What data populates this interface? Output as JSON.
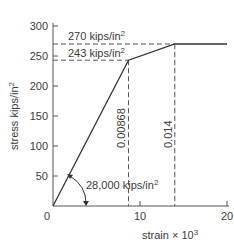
{
  "chart_data": {
    "type": "line",
    "title": "",
    "xlabel": "strain",
    "xlabel_suffix": "× 10",
    "xlabel_exp": "3",
    "ylabel": "stress kips/in",
    "ylabel_exp": "2",
    "xlim": [
      0,
      21
    ],
    "ylim": [
      0,
      300
    ],
    "grid": false,
    "x_ticks": [
      0,
      10,
      20
    ],
    "x_tick_labels": [
      "0",
      "10",
      "20"
    ],
    "y_ticks": [
      50,
      100,
      150,
      200,
      250,
      300
    ],
    "y_tick_labels": [
      "50",
      "100",
      "150",
      "200",
      "250",
      "300"
    ],
    "series": [
      {
        "name": "stress-strain curve",
        "x": [
          0,
          8.68,
          14,
          20
        ],
        "y": [
          0,
          243,
          270,
          270
        ]
      }
    ],
    "reference_lines": [
      {
        "kind": "horizontal",
        "y": 270,
        "x_end": 14,
        "label": "270 kips/in",
        "label_exp": "2"
      },
      {
        "kind": "horizontal",
        "y": 243,
        "x_end": 8.68,
        "label": "243 kips/in",
        "label_exp": "2"
      },
      {
        "kind": "vertical",
        "x": 8.68,
        "y_end": 243,
        "label": "0.00868"
      },
      {
        "kind": "vertical",
        "x": 14,
        "y_end": 270,
        "label": "0.014"
      }
    ],
    "annotations": [
      {
        "text": "28,000 kips/in",
        "text_exp": "2",
        "meaning": "slope (modulus) of initial linear segment"
      }
    ]
  }
}
